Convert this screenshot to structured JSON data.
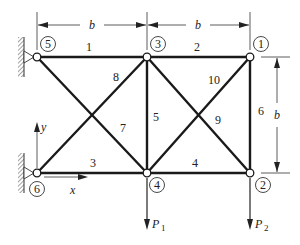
{
  "diagram": {
    "type": "planar truss",
    "dimensions": {
      "top_left": "b",
      "top_right": "b",
      "right_height": "b"
    },
    "nodes": [
      {
        "id": "1",
        "label": "1",
        "x": 250,
        "y": 57
      },
      {
        "id": "2",
        "label": "2",
        "x": 250,
        "y": 173
      },
      {
        "id": "3",
        "label": "3",
        "x": 147,
        "y": 57
      },
      {
        "id": "4",
        "label": "4",
        "x": 147,
        "y": 173
      },
      {
        "id": "5",
        "label": "5",
        "x": 37,
        "y": 57,
        "support": "pin (wall)"
      },
      {
        "id": "6",
        "label": "6",
        "x": 37,
        "y": 173,
        "support": "pin (wall)"
      }
    ],
    "members": [
      {
        "label": "1",
        "from": "5",
        "to": "3"
      },
      {
        "label": "2",
        "from": "3",
        "to": "1"
      },
      {
        "label": "3",
        "from": "6",
        "to": "4"
      },
      {
        "label": "4",
        "from": "4",
        "to": "2"
      },
      {
        "label": "5",
        "from": "3",
        "to": "4"
      },
      {
        "label": "6",
        "from": "1",
        "to": "2"
      },
      {
        "label": "7",
        "from": "5",
        "to": "4"
      },
      {
        "label": "8",
        "from": "6",
        "to": "3"
      },
      {
        "label": "9",
        "from": "3",
        "to": "2"
      },
      {
        "label": "10",
        "from": "4",
        "to": "1"
      }
    ],
    "loads": [
      {
        "label": "P",
        "subscript": "1",
        "node": "4",
        "direction": "down"
      },
      {
        "label": "P",
        "subscript": "2",
        "node": "2",
        "direction": "down"
      }
    ],
    "axes": {
      "x_label": "x",
      "y_label": "y"
    }
  }
}
